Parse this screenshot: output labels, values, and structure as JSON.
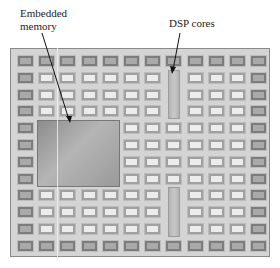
{
  "labels": {
    "memory": "Embedded memory",
    "dsp": "DSP cores"
  },
  "grid": {
    "columns": 12,
    "rows": 12,
    "memory_block": {
      "col_start": 2,
      "col_end": 5,
      "row_start": 5,
      "row_end": 8
    },
    "dsp_blocks": [
      {
        "col": 8,
        "row_start": 2,
        "row_end": 4
      },
      {
        "col": 8,
        "row_start": 9,
        "row_end": 11
      }
    ]
  },
  "colors": {
    "frame": "#d4d4d4",
    "cell_light": "#ececec",
    "cell_dark": "#a9a9a9",
    "memory": "#a0a0a0",
    "dsp": "#c0c0c0"
  }
}
